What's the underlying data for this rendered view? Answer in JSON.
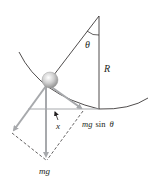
{
  "diagram": {
    "labels": {
      "theta": "θ",
      "radius": "R",
      "displacement": "x",
      "tangential_force_mg": "mg",
      "tangential_force_sin": "sin",
      "tangential_force_theta": "θ",
      "weight": "mg"
    },
    "colors": {
      "line": "#231f20",
      "arrow": "#a7a9ac",
      "ball": "#c8c8c8"
    }
  }
}
